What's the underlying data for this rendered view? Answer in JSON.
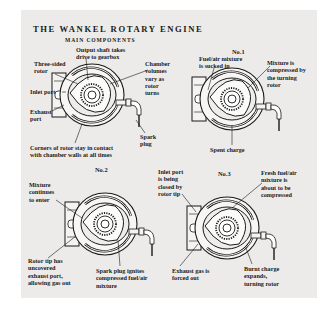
{
  "title": "THE WANKEL ROTARY ENGINE",
  "colors": {
    "panel": "#ecebe9",
    "ink": "#1a1a1a",
    "page": "#ffffff"
  },
  "diagrams": [
    {
      "id": "main-components",
      "heading": "MAIN COMPONENTS",
      "labels": {
        "output_shaft_1": "Output shaft takes",
        "output_shaft_2": "drive to gearbox",
        "rotor_1": "Three-sided",
        "rotor_2": "rotor",
        "chamber_1": "Chamber",
        "chamber_2": "volumes",
        "chamber_3": "vary as",
        "chamber_4": "rotor",
        "chamber_5": "turns",
        "inlet": "Inlet port",
        "exhaust_1": "Exhaust",
        "exhaust_2": "port",
        "spark_1": "Spark",
        "spark_2": "plug",
        "corners_1": "Corners of rotor stay in contact",
        "corners_2": "with chamber walls at all times"
      }
    },
    {
      "id": "stage-1",
      "heading": "No.1",
      "labels": {
        "intake_1": "Fuel/air mixture",
        "intake_2": "is sucked in",
        "compress_1": "Mixture is",
        "compress_2": "compressed by",
        "compress_3": "the turning",
        "compress_4": "rotor",
        "spent": "Spent charge"
      }
    },
    {
      "id": "stage-2",
      "heading": "No.2",
      "labels": {
        "continue_1": "Mixture",
        "continue_2": "continues",
        "continue_3": "to enter",
        "tip_1": "Rotor tip has",
        "tip_2": "uncovered",
        "tip_3": "exhaust port,",
        "tip_4": "allowing gas out",
        "ignite_1": "Spark plug ignites",
        "ignite_2": "compressed fuel/air",
        "ignite_3": "mixture"
      }
    },
    {
      "id": "stage-3",
      "heading": "No.3",
      "labels": {
        "inlet_close_1": "Inlet port",
        "inlet_close_2": "is being",
        "inlet_close_3": "closed by",
        "inlet_close_4": "rotor tip",
        "fresh_1": "Fresh fuel/air",
        "fresh_2": "mixture is",
        "fresh_3": "about to be",
        "fresh_4": "compressed",
        "exhaust_1": "Exhaust gas is",
        "exhaust_2": "forced out",
        "burnt_1": "Burnt charge",
        "burnt_2": "expands,",
        "burnt_3": "turning rotor"
      }
    }
  ]
}
